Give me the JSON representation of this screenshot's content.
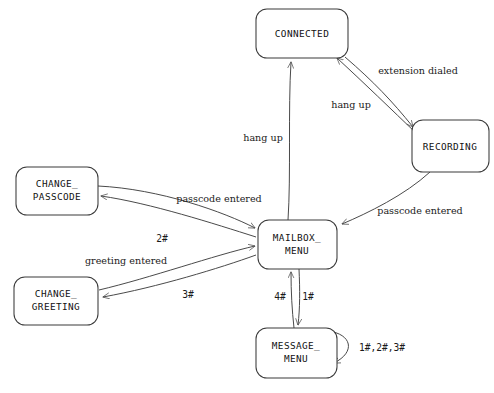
{
  "diagram": {
    "colors": {
      "background": "#ffffff",
      "stroke": "#4a4a4a",
      "box_stroke": "#3a3a3a",
      "text": "#111111"
    },
    "states": [
      {
        "id": "connected",
        "label": "CONNECTED",
        "label_lines": [
          "CONNECTED"
        ]
      },
      {
        "id": "recording",
        "label": "RECORDING",
        "label_lines": [
          "RECORDING"
        ]
      },
      {
        "id": "change_passcode",
        "label": "CHANGE_ PASSCODE",
        "label_lines": [
          "CHANGE_",
          "PASSCODE"
        ]
      },
      {
        "id": "change_greeting",
        "label": "CHANGE_ GREETING",
        "label_lines": [
          "CHANGE_",
          "GREETING"
        ]
      },
      {
        "id": "mailbox_menu",
        "label": "MAILBOX_ MENU",
        "label_lines": [
          "MAILBOX_",
          "MENU"
        ]
      },
      {
        "id": "message_menu",
        "label": "MESSAGE_ MENU",
        "label_lines": [
          "MESSAGE_",
          "MENU"
        ]
      }
    ],
    "transitions": [
      {
        "id": "t1",
        "from": "connected",
        "to": "recording",
        "label": "extension dialed"
      },
      {
        "id": "t2",
        "from": "recording",
        "to": "connected",
        "label": "hang up"
      },
      {
        "id": "t3",
        "from": "mailbox_menu",
        "to": "connected",
        "label": "hang up"
      },
      {
        "id": "t4",
        "from": "recording",
        "to": "mailbox_menu",
        "label": "passcode entered"
      },
      {
        "id": "t5",
        "from": "change_passcode",
        "to": "mailbox_menu",
        "label": "passcode entered"
      },
      {
        "id": "t6",
        "from": "mailbox_menu",
        "to": "change_passcode",
        "label": "2#"
      },
      {
        "id": "t7",
        "from": "change_greeting",
        "to": "mailbox_menu",
        "label": "greeting entered"
      },
      {
        "id": "t8",
        "from": "mailbox_menu",
        "to": "change_greeting",
        "label": "3#"
      },
      {
        "id": "t9",
        "from": "message_menu",
        "to": "mailbox_menu",
        "label": "4#"
      },
      {
        "id": "t10",
        "from": "mailbox_menu",
        "to": "message_menu",
        "label": "1#"
      },
      {
        "id": "t11",
        "from": "message_menu",
        "to": "message_menu",
        "label": "1#,2#,3#"
      }
    ]
  }
}
